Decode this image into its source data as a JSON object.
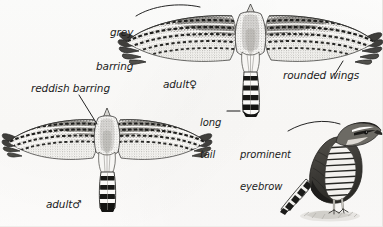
{
  "plate": {
    "title": "Hawk identification plate",
    "background_color": "#fcfbf9",
    "ink_color": "#1c1c1c"
  },
  "labels": [
    {
      "id": "grey-barring",
      "line1": "grey",
      "line2": "barring",
      "text": "grey barring",
      "x": 96,
      "y": 6,
      "leader": "curve-right"
    },
    {
      "id": "adult-female",
      "line1": "adult",
      "line2": "",
      "text": "adult",
      "symbol": "♀",
      "x": 150,
      "y": 69,
      "leader": "none"
    },
    {
      "id": "rounded-wings",
      "line1": "rounded wings",
      "line2": "",
      "text": "rounded wings",
      "x": 285,
      "y": 71,
      "leader": "short-diagonal"
    },
    {
      "id": "reddish-barring",
      "line1": "reddish barring",
      "line2": "",
      "text": "reddish barring",
      "x": 31,
      "y": 84,
      "leader": "diagonal-down-right"
    },
    {
      "id": "long-tail",
      "line1": "long",
      "line2": "tail",
      "text": "long tail",
      "x": 200,
      "y": 98,
      "leader": "dash-right"
    },
    {
      "id": "prominent-eyebrow",
      "line1": "prominent",
      "line2": "eyebrow",
      "text": "prominent eyebrow",
      "x": 241,
      "y": 130,
      "leader": "arc-up-right"
    },
    {
      "id": "adult-male",
      "line1": "adult",
      "line2": "",
      "text": "adult",
      "symbol": "♂",
      "x": 33,
      "y": 189,
      "leader": "none"
    }
  ],
  "figures": [
    {
      "id": "adult-female-flight",
      "name": "adult female in flight, seen from above",
      "position": "top-center"
    },
    {
      "id": "adult-male-flight",
      "name": "adult male in flight, seen from above",
      "position": "lower-left"
    },
    {
      "id": "perched-adult",
      "name": "perched adult, side view facing right",
      "position": "lower-right"
    }
  ]
}
